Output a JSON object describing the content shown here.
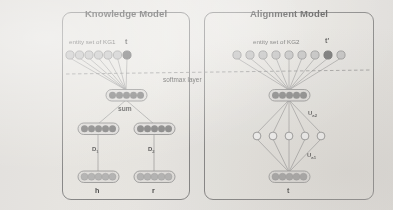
{
  "figure": {
    "background_color": "#eceae6",
    "panel_border_color": "#6f6f6f"
  },
  "panels": [
    {
      "id": "knowledge-model",
      "title": "Knowledge Model",
      "entity_set_label": "entity set of KG1",
      "target_label": "t",
      "entity_count": 7,
      "highlighted_entity_index": 6,
      "sum_label": "sum",
      "projection_labels": [
        "D",
        "D"
      ],
      "projection_subscripts": [
        "1",
        "2"
      ],
      "input_labels": [
        "h",
        "r"
      ],
      "layer_node_count": 5
    },
    {
      "id": "alignment-model",
      "title": "Alignment Model",
      "entity_set_label": "entity set of KG2",
      "target_label": "t'",
      "entity_count": 9,
      "highlighted_entity_index": 7,
      "weight_labels": [
        "U",
        "U"
      ],
      "weight_subscripts": [
        "a2",
        "a1"
      ],
      "input_labels": [
        "t"
      ],
      "layer_node_count": 5,
      "hidden_node_count": 5
    }
  ],
  "shared": {
    "softmax_label": "softmax layer"
  },
  "colors": {
    "dark_node": "#6b6b6b",
    "light_node": "#a9a9a9",
    "target_node": "#4a4a4a",
    "entity_node": "#b9b9b9",
    "hollow_node": "#ffffff",
    "edge": "#8a8a8a",
    "pill_stroke": "#7a7a7a"
  }
}
